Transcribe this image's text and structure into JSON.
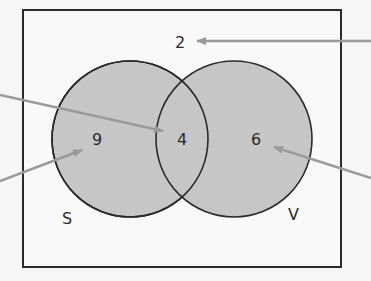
{
  "diagram": {
    "type": "venn",
    "sets": [
      {
        "name": "S",
        "only_count": "9"
      },
      {
        "name": "V",
        "only_count": "6"
      }
    ],
    "intersection_count": "4",
    "outside_count": "2",
    "labels": {
      "set_left": "S",
      "set_right": "V",
      "left_only": "9",
      "intersection": "4",
      "right_only": "6",
      "outside": "2"
    },
    "colors": {
      "circle_fill": "#c8c8c8",
      "stroke": "#2a2a2a",
      "arrow": "#9a9a9a",
      "background": "#f6f6f6"
    }
  }
}
